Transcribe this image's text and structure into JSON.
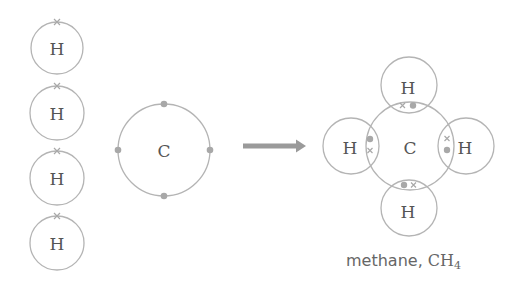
{
  "reactants": {
    "hydrogen_atoms": [
      {
        "symbol": "H",
        "electron": "cross"
      },
      {
        "symbol": "H",
        "electron": "cross"
      },
      {
        "symbol": "H",
        "electron": "cross"
      },
      {
        "symbol": "H",
        "electron": "cross"
      }
    ],
    "carbon_atom": {
      "symbol": "C",
      "outer_electrons": 4,
      "electron": "dot"
    }
  },
  "arrow": {
    "direction": "right"
  },
  "product": {
    "center": {
      "symbol": "C"
    },
    "bonded_hydrogens": [
      {
        "position": "top",
        "symbol": "H",
        "shared_pair": [
          "cross",
          "dot"
        ]
      },
      {
        "position": "left",
        "symbol": "H",
        "shared_pair": [
          "dot",
          "cross"
        ]
      },
      {
        "position": "right",
        "symbol": "H",
        "shared_pair": [
          "cross",
          "dot"
        ]
      },
      {
        "position": "bottom",
        "symbol": "H",
        "shared_pair": [
          "dot",
          "cross"
        ]
      }
    ],
    "caption": {
      "name": "methane, ",
      "formula_main": "CH",
      "formula_sub": "4"
    }
  },
  "colors": {
    "ring": "#b4b4b4",
    "electron": "#a8a8a8",
    "text": "#555555",
    "arrow": "#9a9a9a"
  }
}
